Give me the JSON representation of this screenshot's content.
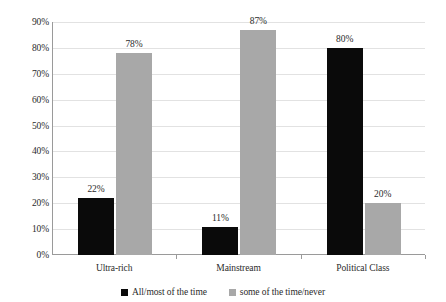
{
  "chart_data": {
    "type": "bar",
    "title": "",
    "subtitle": "",
    "xlabel": "",
    "ylabel": "",
    "ylim": [
      0,
      90
    ],
    "ytick_step": 10,
    "grid": true,
    "legend_position": "bottom",
    "categories": [
      "Ultra-rich",
      "Mainstream",
      "Political Class"
    ],
    "ytick_labels": [
      "90%",
      "80%",
      "70%",
      "60%",
      "50%",
      "40%",
      "30%",
      "20%",
      "10%",
      "0%"
    ],
    "ytick_values": [
      90,
      80,
      70,
      60,
      50,
      40,
      30,
      20,
      10,
      0
    ],
    "series": [
      {
        "name": "All/most of the time",
        "color": "#0a0a0a",
        "values": [
          22,
          11,
          80
        ],
        "labels": [
          "22%",
          "11%",
          "80%"
        ]
      },
      {
        "name": "some of the time/never",
        "color": "#a8a8a8",
        "values": [
          78,
          87,
          20
        ],
        "labels": [
          "78%",
          "87%",
          "20%"
        ]
      }
    ]
  },
  "legend": {
    "items": [
      {
        "label": "All/most of the time",
        "color": "#0a0a0a"
      },
      {
        "label": "some of the time/never",
        "color": "#a8a8a8"
      }
    ]
  },
  "colors": {
    "series_dark": "#0a0a0a",
    "series_light": "#a8a8a8",
    "axis": "#9a9a9a",
    "gridline": "#e2e2e2",
    "text": "#2b2b2b",
    "background": "#ffffff"
  }
}
